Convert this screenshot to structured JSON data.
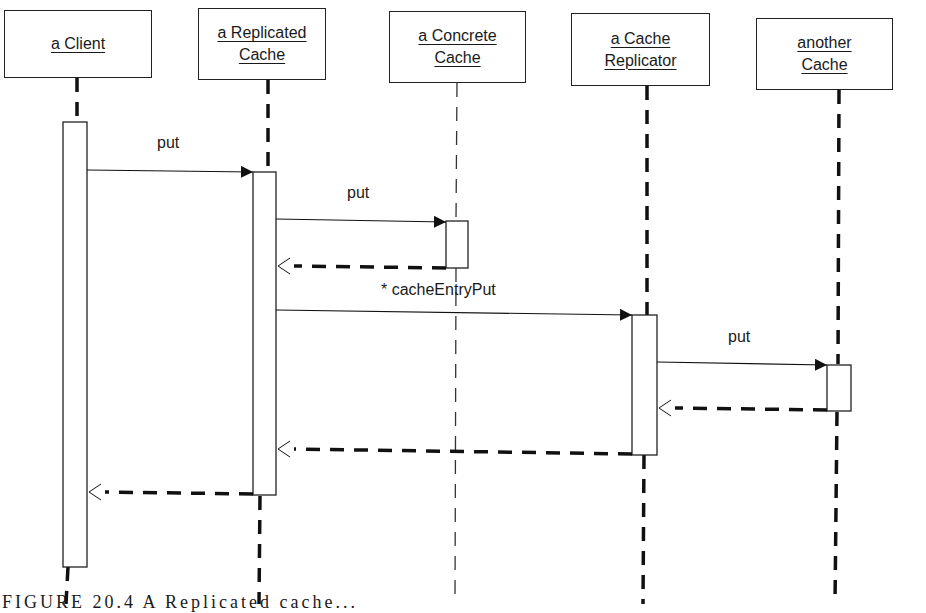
{
  "diagram": {
    "type": "UML sequence diagram",
    "participants": [
      {
        "id": "client",
        "line1": "a Client",
        "line2": ""
      },
      {
        "id": "replicated",
        "line1": "a Replicated",
        "line2": "Cache"
      },
      {
        "id": "concrete",
        "line1": "a Concrete",
        "line2": "Cache"
      },
      {
        "id": "replicator",
        "line1": "a Cache",
        "line2": "Replicator"
      },
      {
        "id": "another",
        "line1": "another",
        "line2": "Cache"
      }
    ],
    "messages": [
      {
        "from": "client",
        "to": "replicated",
        "label": "put",
        "kind": "call"
      },
      {
        "from": "replicated",
        "to": "concrete",
        "label": "put",
        "kind": "call"
      },
      {
        "from": "concrete",
        "to": "replicated",
        "label": "",
        "kind": "return"
      },
      {
        "from": "replicated",
        "to": "replicator",
        "label": "* cacheEntryPut",
        "kind": "call"
      },
      {
        "from": "replicator",
        "to": "another",
        "label": "put",
        "kind": "call"
      },
      {
        "from": "another",
        "to": "replicator",
        "label": "",
        "kind": "return"
      },
      {
        "from": "replicator",
        "to": "replicated",
        "label": "",
        "kind": "return"
      },
      {
        "from": "replicated",
        "to": "client",
        "label": "",
        "kind": "return"
      }
    ],
    "caption": "FIGURE 20.4 A Replicated cache..."
  }
}
